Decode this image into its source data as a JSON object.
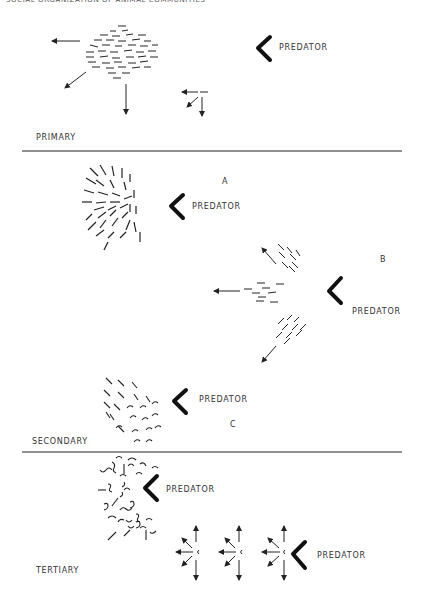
{
  "header": {
    "text": "SOCIAL ORGANIZATION OF ANIMAL COMMUNITIES"
  },
  "colors": {
    "ink": "#222222",
    "background": "#ffffff"
  },
  "sections": [
    {
      "name": "primary",
      "label": "PRIMARY",
      "predators": [
        {
          "label": "PREDATOR"
        }
      ]
    },
    {
      "name": "secondary",
      "label": "SECONDARY",
      "panels": [
        {
          "letter": "A",
          "predator_label": "PREDATOR"
        },
        {
          "letter": "B",
          "predator_label": "PREDATOR"
        },
        {
          "letter": "C",
          "predator_label": "PREDATOR"
        }
      ]
    },
    {
      "name": "tertiary",
      "label": "TERTIARY",
      "predators": [
        {
          "label": "PREDATOR"
        },
        {
          "label": "PREDATOR"
        }
      ]
    }
  ]
}
